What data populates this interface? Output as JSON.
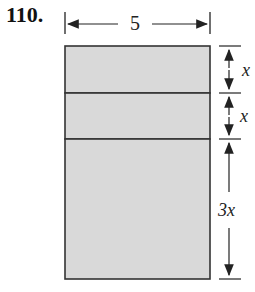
{
  "problem": {
    "number": "110."
  },
  "diagram": {
    "width_label": "5",
    "segments": [
      {
        "label": "x",
        "height_units": 1
      },
      {
        "label": "x",
        "height_units": 1
      },
      {
        "label": "3x",
        "height_units": 3
      }
    ],
    "colors": {
      "fill": "#d9d9d9",
      "stroke": "#333333",
      "arrow": "#222222"
    }
  }
}
